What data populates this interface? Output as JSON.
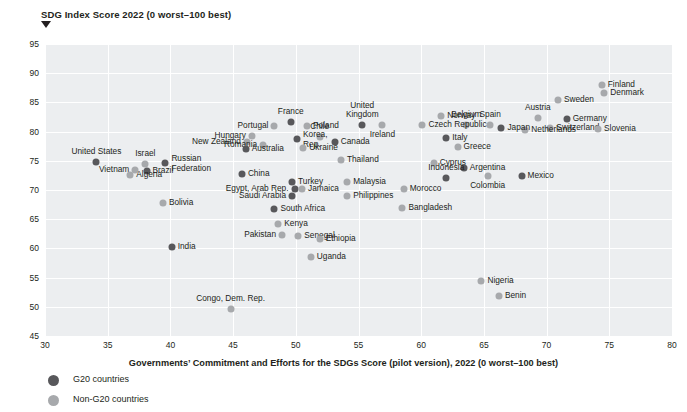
{
  "chart_data": {
    "type": "scatter",
    "title": "",
    "ylabel": "SDG Index Score 2022 (0 worst–100 best)",
    "xlabel": "Governments’ Commitment and Efforts for the SDGs Score (pilot version), 2022 (0 worst–100 best)",
    "xlim": [
      30,
      80
    ],
    "ylim": [
      45,
      95
    ],
    "xticks": [
      30,
      35,
      40,
      45,
      50,
      55,
      60,
      65,
      70,
      75,
      80
    ],
    "yticks": [
      45,
      50,
      55,
      60,
      65,
      70,
      75,
      80,
      85,
      90,
      95
    ],
    "grid": true,
    "legend_position": "bottom-left",
    "colors": {
      "g20": "#58585b",
      "non_g20": "#a7a9ac",
      "plot_background": "#eceef0",
      "gridline": "#ffffff"
    },
    "series": [
      {
        "name": "G20 countries",
        "color": "#58585b"
      },
      {
        "name": "Non-G20 countries",
        "color": "#a7a9ac"
      }
    ],
    "points": [
      {
        "label": "Finland",
        "x": 74.4,
        "y": 88.0,
        "group": "non",
        "lpos": "rgt"
      },
      {
        "label": "Denmark",
        "x": 74.6,
        "y": 86.6,
        "group": "non",
        "lpos": "rgt"
      },
      {
        "label": "Sweden",
        "x": 70.9,
        "y": 85.4,
        "group": "non",
        "lpos": "rgt"
      },
      {
        "label": "Austria",
        "x": 69.3,
        "y": 82.4,
        "group": "non",
        "lpos": "ctr-top"
      },
      {
        "label": "Germany",
        "x": 71.6,
        "y": 82.1,
        "group": "g20",
        "lpos": "rgt"
      },
      {
        "label": "Switzerland",
        "x": 70.3,
        "y": 80.7,
        "group": "non",
        "lpos": "rgt"
      },
      {
        "label": "Slovenia",
        "x": 74.1,
        "y": 80.4,
        "group": "non",
        "lpos": "rgt"
      },
      {
        "label": "Netherlands",
        "x": 68.3,
        "y": 80.2,
        "group": "non",
        "lpos": "rgt"
      },
      {
        "label": "Norway",
        "x": 61.6,
        "y": 82.6,
        "group": "non",
        "lpos": "rgt"
      },
      {
        "label": "Belgium",
        "x": 63.6,
        "y": 81.1,
        "group": "non",
        "lpos": "ctr-top"
      },
      {
        "label": "Spain",
        "x": 65.5,
        "y": 81.1,
        "group": "non",
        "lpos": "ctr-top"
      },
      {
        "label": "Japan",
        "x": 66.4,
        "y": 80.7,
        "group": "g20",
        "lpos": "rgt"
      },
      {
        "label": "Czech Republic",
        "x": 60.1,
        "y": 81.1,
        "group": "non",
        "lpos": "rgt"
      },
      {
        "label": "Italy",
        "x": 62.0,
        "y": 78.9,
        "group": "g20",
        "lpos": "rgt"
      },
      {
        "label": "Greece",
        "x": 62.9,
        "y": 77.4,
        "group": "non",
        "lpos": "rgt"
      },
      {
        "label": "United Kingdom",
        "x": 55.3,
        "y": 81.2,
        "group": "g20",
        "lpos": "ctr-top2"
      },
      {
        "label": "Ireland",
        "x": 56.9,
        "y": 81.2,
        "group": "non",
        "lpos": "ctr-bot"
      },
      {
        "label": "France",
        "x": 49.6,
        "y": 81.6,
        "group": "g20",
        "lpos": "ctr-top"
      },
      {
        "label": "Poland",
        "x": 50.9,
        "y": 80.9,
        "group": "non",
        "lpos": "rgt"
      },
      {
        "label": "Portugal",
        "x": 48.3,
        "y": 80.9,
        "group": "non",
        "lpos": "lft"
      },
      {
        "label": "Hungary",
        "x": 46.5,
        "y": 79.2,
        "group": "non",
        "lpos": "lft"
      },
      {
        "label": "New Zealand",
        "x": 46.1,
        "y": 78.2,
        "group": "non",
        "lpos": "lft"
      },
      {
        "label": "Chile",
        "x": 51.9,
        "y": 79.0,
        "group": "non",
        "lpos": "ctr-top"
      },
      {
        "label": "Korea, Rep.",
        "x": 50.1,
        "y": 78.7,
        "group": "g20",
        "lpos": "rgt2"
      },
      {
        "label": "Romania",
        "x": 47.4,
        "y": 77.7,
        "group": "non",
        "lpos": "lft"
      },
      {
        "label": "Canada",
        "x": 53.1,
        "y": 78.2,
        "group": "g20",
        "lpos": "rgt"
      },
      {
        "label": "Ukraine",
        "x": 50.6,
        "y": 77.2,
        "group": "non",
        "lpos": "rgt"
      },
      {
        "label": "Australia",
        "x": 46.0,
        "y": 77.1,
        "group": "g20",
        "lpos": "rgt"
      },
      {
        "label": "Thailand",
        "x": 53.6,
        "y": 75.2,
        "group": "non",
        "lpos": "rgt"
      },
      {
        "label": "Cyprus",
        "x": 61.0,
        "y": 74.7,
        "group": "non",
        "lpos": "rgt"
      },
      {
        "label": "Argentina",
        "x": 63.4,
        "y": 73.7,
        "group": "g20",
        "lpos": "rgt"
      },
      {
        "label": "Mexico",
        "x": 68.0,
        "y": 72.4,
        "group": "g20",
        "lpos": "rgt"
      },
      {
        "label": "Indonesia",
        "x": 62.0,
        "y": 72.0,
        "group": "g20",
        "lpos": "ctr-top"
      },
      {
        "label": "Colombia",
        "x": 65.3,
        "y": 72.4,
        "group": "non",
        "lpos": "ctr-bot"
      },
      {
        "label": "United States",
        "x": 34.1,
        "y": 74.8,
        "group": "g20",
        "lpos": "ctr-top"
      },
      {
        "label": "Israel",
        "x": 38.0,
        "y": 74.4,
        "group": "non",
        "lpos": "ctr-top"
      },
      {
        "label": "Russian Federation",
        "x": 39.6,
        "y": 74.6,
        "group": "g20",
        "lpos": "rgt2"
      },
      {
        "label": "Vietnam",
        "x": 37.2,
        "y": 73.5,
        "group": "non",
        "lpos": "lft"
      },
      {
        "label": "Brazil",
        "x": 38.1,
        "y": 73.3,
        "group": "g20",
        "lpos": "rgt"
      },
      {
        "label": "Algeria",
        "x": 36.8,
        "y": 72.5,
        "group": "non",
        "lpos": "rgt"
      },
      {
        "label": "China",
        "x": 45.7,
        "y": 72.7,
        "group": "g20",
        "lpos": "rgt"
      },
      {
        "label": "Turkey",
        "x": 49.7,
        "y": 71.4,
        "group": "g20",
        "lpos": "rgt"
      },
      {
        "label": "Malaysia",
        "x": 54.1,
        "y": 71.3,
        "group": "non",
        "lpos": "rgt"
      },
      {
        "label": "Egypt, Arab Rep.",
        "x": 49.9,
        "y": 70.2,
        "group": "g20",
        "lpos": "lft"
      },
      {
        "label": "Jamaica",
        "x": 50.5,
        "y": 70.2,
        "group": "non",
        "lpos": "rgt"
      },
      {
        "label": "Morocco",
        "x": 58.6,
        "y": 70.2,
        "group": "non",
        "lpos": "rgt"
      },
      {
        "label": "Saudi Arabia",
        "x": 49.7,
        "y": 68.9,
        "group": "g20",
        "lpos": "lft"
      },
      {
        "label": "Philippines",
        "x": 54.1,
        "y": 68.9,
        "group": "non",
        "lpos": "rgt"
      },
      {
        "label": "Bolivia",
        "x": 39.4,
        "y": 67.7,
        "group": "non",
        "lpos": "rgt"
      },
      {
        "label": "Bangladesh",
        "x": 58.5,
        "y": 67.0,
        "group": "non",
        "lpos": "rgt"
      },
      {
        "label": "South Africa",
        "x": 48.3,
        "y": 66.8,
        "group": "g20",
        "lpos": "rgt"
      },
      {
        "label": "Kenya",
        "x": 48.6,
        "y": 64.2,
        "group": "non",
        "lpos": "rgt"
      },
      {
        "label": "India",
        "x": 40.1,
        "y": 60.3,
        "group": "g20",
        "lpos": "rgt"
      },
      {
        "label": "Pakistan",
        "x": 48.9,
        "y": 62.3,
        "group": "non",
        "lpos": "lft"
      },
      {
        "label": "Senegal",
        "x": 50.2,
        "y": 62.1,
        "group": "non",
        "lpos": "rgt"
      },
      {
        "label": "Ethiopia",
        "x": 51.9,
        "y": 61.6,
        "group": "non",
        "lpos": "rgt"
      },
      {
        "label": "Uganda",
        "x": 51.2,
        "y": 58.6,
        "group": "non",
        "lpos": "rgt"
      },
      {
        "label": "Nigeria",
        "x": 64.8,
        "y": 54.4,
        "group": "non",
        "lpos": "rgt"
      },
      {
        "label": "Benin",
        "x": 66.2,
        "y": 51.9,
        "group": "non",
        "lpos": "rgt"
      },
      {
        "label": "Congo, Dem. Rep.",
        "x": 44.8,
        "y": 49.7,
        "group": "non",
        "lpos": "ctr-top"
      }
    ]
  },
  "legend": {
    "items": [
      {
        "label": "G20 countries",
        "group": "g20"
      },
      {
        "label": "Non-G20 countries",
        "group": "non"
      }
    ]
  }
}
